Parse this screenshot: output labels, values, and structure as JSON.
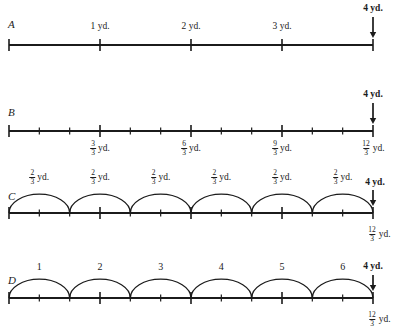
{
  "figure": {
    "axis_color": "#1b1b1b",
    "background": "#ffffff"
  },
  "chart_data": {
    "type": "line",
    "xlabel": "",
    "ylabel": "",
    "xlim": [
      0,
      4
    ],
    "grid": false,
    "legend": null,
    "lines": [
      {
        "id": "A",
        "label": "A",
        "range": [
          0,
          4
        ],
        "major_ticks": [
          0,
          1,
          2,
          3,
          4
        ],
        "minor_ticks": [],
        "tick_labels": [
          "",
          "1 yd.",
          "2 yd.",
          "3 yd.",
          ""
        ],
        "arcs": [],
        "arc_labels": []
      },
      {
        "id": "B",
        "label": "B",
        "range": [
          0,
          4
        ],
        "major_ticks": [
          0,
          1,
          2,
          3,
          4
        ],
        "minor_ticks": [
          0.3333,
          0.6667,
          1.3333,
          1.6667,
          2.3333,
          2.6667,
          3.3333,
          3.6667
        ],
        "tick_labels_below": [
          {
            "x": 1,
            "numerator": "3",
            "denominator": "3",
            "unit": "yd."
          },
          {
            "x": 2,
            "numerator": "6",
            "denominator": "3",
            "unit": "yd."
          },
          {
            "x": 3,
            "numerator": "9",
            "denominator": "3",
            "unit": "yd."
          },
          {
            "x": 4,
            "numerator": "12",
            "denominator": "3",
            "unit": "yd."
          }
        ],
        "arcs": [],
        "arc_labels": []
      },
      {
        "id": "C",
        "label": "C",
        "range": [
          0,
          4
        ],
        "major_ticks": [
          0,
          1,
          2,
          3,
          4
        ],
        "minor_ticks": [
          0.3333,
          0.6667,
          1.3333,
          1.6667,
          2.3333,
          2.6667,
          3.3333,
          3.6667
        ],
        "arcs": [
          {
            "from": 0.0,
            "to": 0.6667
          },
          {
            "from": 0.6667,
            "to": 1.3333
          },
          {
            "from": 1.3333,
            "to": 2.0
          },
          {
            "from": 2.0,
            "to": 2.6667
          },
          {
            "from": 2.6667,
            "to": 3.3333
          },
          {
            "from": 3.3333,
            "to": 4.0
          }
        ],
        "arc_labels": [
          {
            "numerator": "2",
            "denominator": "3",
            "unit": "yd."
          },
          {
            "numerator": "2",
            "denominator": "3",
            "unit": "yd."
          },
          {
            "numerator": "2",
            "denominator": "3",
            "unit": "yd."
          },
          {
            "numerator": "2",
            "denominator": "3",
            "unit": "yd."
          },
          {
            "numerator": "2",
            "denominator": "3",
            "unit": "yd."
          },
          {
            "numerator": "2",
            "denominator": "3",
            "unit": "yd."
          }
        ],
        "end_label": {
          "numerator": "12",
          "denominator": "3",
          "unit": "yd."
        }
      },
      {
        "id": "D",
        "label": "D",
        "range": [
          0,
          4
        ],
        "major_ticks": [
          0,
          1,
          2,
          3,
          4
        ],
        "minor_ticks": [
          0.3333,
          0.6667,
          1.3333,
          1.6667,
          2.3333,
          2.6667,
          3.3333,
          3.6667
        ],
        "arcs": [
          {
            "from": 0.0,
            "to": 0.6667
          },
          {
            "from": 0.6667,
            "to": 1.3333
          },
          {
            "from": 1.3333,
            "to": 2.0
          },
          {
            "from": 2.0,
            "to": 2.6667
          },
          {
            "from": 2.6667,
            "to": 3.3333
          },
          {
            "from": 3.3333,
            "to": 4.0
          }
        ],
        "arc_labels": [
          "1",
          "2",
          "3",
          "4",
          "5",
          "6"
        ],
        "end_label": {
          "numerator": "12",
          "denominator": "3",
          "unit": "yd."
        }
      }
    ],
    "end_marker": {
      "label": "4 yd.",
      "icon": "down-arrow",
      "x": 4,
      "appears_on": [
        "A",
        "B",
        "C",
        "D"
      ]
    }
  },
  "lineA": {
    "letter": "A",
    "labels": [
      "1 yd.",
      "2 yd.",
      "3 yd."
    ],
    "end_marker": "4 yd."
  },
  "lineB": {
    "letter": "B",
    "end_marker": "4 yd.",
    "fractions": [
      {
        "num": "3",
        "den": "3",
        "unit": "yd."
      },
      {
        "num": "6",
        "den": "3",
        "unit": "yd."
      },
      {
        "num": "9",
        "den": "3",
        "unit": "yd."
      },
      {
        "num": "12",
        "den": "3",
        "unit": "yd."
      }
    ]
  },
  "lineC": {
    "letter": "C",
    "end_marker": "4 yd.",
    "arc_fraction": {
      "num": "2",
      "den": "3",
      "unit": "yd."
    },
    "end_fraction": {
      "num": "12",
      "den": "3",
      "unit": "yd."
    }
  },
  "lineD": {
    "letter": "D",
    "end_marker": "4 yd.",
    "arc_numbers": [
      "1",
      "2",
      "3",
      "4",
      "5",
      "6"
    ],
    "end_fraction": {
      "num": "12",
      "den": "3",
      "unit": "yd."
    }
  }
}
